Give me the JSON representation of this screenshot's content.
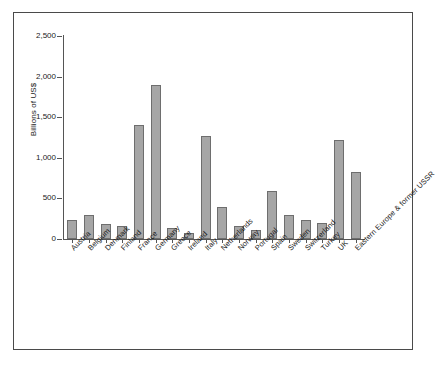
{
  "chart_data": {
    "type": "bar",
    "title": "",
    "xlabel": "",
    "ylabel": "Billions of US$",
    "ylim": [
      0,
      2500
    ],
    "ytick_labels": [
      "0",
      "500",
      "1,000",
      "1,500",
      "2,000",
      "2,500"
    ],
    "ytick_values": [
      0,
      500,
      1000,
      1500,
      2000,
      2500
    ],
    "grid": false,
    "legend": "none",
    "categories": [
      "Austria",
      "Belgium",
      "Denmark",
      "Finland",
      "France",
      "Germany",
      "Greece",
      "Ireland",
      "Italy",
      "Netherlands",
      "Norway",
      "Portugal",
      "Spain",
      "Sweden",
      "Switzerland",
      "Turkey",
      "UK",
      "Eastern Europe & former USSR"
    ],
    "values": [
      230,
      300,
      185,
      160,
      1400,
      1900,
      135,
      75,
      1270,
      390,
      165,
      105,
      590,
      300,
      240,
      195,
      1220,
      820
    ],
    "bar_color": "#a6a6a6",
    "bar_edge_color": "#6e6e6e",
    "axis_color": "#555555",
    "frame_color": "#4a4a4a",
    "text_color": "#1a1a1a"
  }
}
